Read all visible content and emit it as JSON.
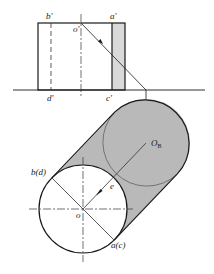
{
  "diagram": {
    "type": "technical-drawing-shadow-projection",
    "colors": {
      "line": "#1a1a1a",
      "thin_line": "#333333",
      "shadow_fill": "#b9b9b9",
      "strip_fill": "#d6d6d6",
      "background": "#ffffff"
    },
    "front_view": {
      "labels": {
        "b_prime": "b'",
        "a_prime": "a'",
        "o_prime": "o'",
        "d_prime": "d'",
        "c_prime": "c'"
      }
    },
    "plan_view": {
      "labels": {
        "b_d": "b(d)",
        "a_c": "a(c)",
        "o": "o",
        "e": "e",
        "O_B_main": "O",
        "O_B_sub": "B"
      }
    }
  }
}
